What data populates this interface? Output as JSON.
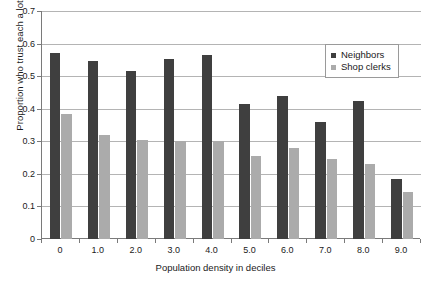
{
  "chart_data": {
    "type": "bar",
    "title": "",
    "xlabel": "Population density in deciles",
    "ylabel": "Proportion who trust each a lot",
    "categories": [
      "0",
      "1.0",
      "2.0",
      "3.0",
      "4.0",
      "5.0",
      "6.0",
      "7.0",
      "8.0",
      "9.0"
    ],
    "series": [
      {
        "name": "Neighbors",
        "color": "#3f3f3f",
        "values": [
          0.57,
          0.548,
          0.515,
          0.553,
          0.565,
          0.415,
          0.44,
          0.36,
          0.425,
          0.185
        ]
      },
      {
        "name": "Shop clerks",
        "color": "#ababab",
        "values": [
          0.385,
          0.32,
          0.305,
          0.3,
          0.3,
          0.255,
          0.28,
          0.245,
          0.23,
          0.145
        ]
      }
    ],
    "ylim": [
      0,
      0.7
    ],
    "yticks": [
      "0",
      "0.1",
      "0.2",
      "0.3",
      "0.4",
      "0.5",
      "0.6",
      "0.7"
    ],
    "ytick_values": [
      0,
      0.1,
      0.2,
      0.3,
      0.4,
      0.5,
      0.6,
      0.7
    ],
    "grid": true,
    "legend_position": "top-right"
  },
  "legend": {
    "items": [
      {
        "label": "Neighbors",
        "swatch": "dark-square-icon"
      },
      {
        "label": "Shop clerks",
        "swatch": "light-square-icon"
      }
    ]
  },
  "axes": {
    "y_title": "Proportion who trust each a lot",
    "x_title": "Population density in deciles"
  }
}
